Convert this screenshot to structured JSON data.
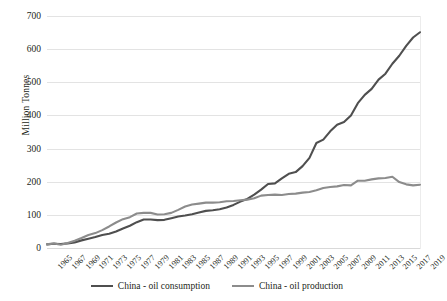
{
  "chart_data": {
    "type": "line",
    "title": "",
    "xlabel": "",
    "ylabel": "Million Tonnes",
    "ylim": [
      0,
      700
    ],
    "ytick_step": 100,
    "yticks": [
      0,
      100,
      200,
      300,
      400,
      500,
      600,
      700
    ],
    "grid": "horizontal",
    "legend_position": "bottom-center",
    "xlim": [
      1965,
      2019
    ],
    "xtick_step": 2,
    "xticks": [
      "1965",
      "1967",
      "1969",
      "1971",
      "1973",
      "1975",
      "1977",
      "1979",
      "1981",
      "1983",
      "1985",
      "1987",
      "1989",
      "1991",
      "1993",
      "1995",
      "1997",
      "1999",
      "2001",
      "2003",
      "2005",
      "2007",
      "2009",
      "2011",
      "2013",
      "2015",
      "2017",
      "2019"
    ],
    "x": [
      1965,
      1966,
      1967,
      1968,
      1969,
      1970,
      1971,
      1972,
      1973,
      1974,
      1975,
      1976,
      1977,
      1978,
      1979,
      1980,
      1981,
      1982,
      1983,
      1984,
      1985,
      1986,
      1987,
      1988,
      1989,
      1990,
      1991,
      1992,
      1993,
      1994,
      1995,
      1996,
      1997,
      1998,
      1999,
      2000,
      2001,
      2002,
      2003,
      2004,
      2005,
      2006,
      2007,
      2008,
      2009,
      2010,
      2011,
      2012,
      2013,
      2014,
      2015,
      2016,
      2017,
      2018,
      2019
    ],
    "series": [
      {
        "name": "China - oil consumption",
        "color": "#4f4f4f",
        "values": [
          11,
          13,
          12,
          14,
          17,
          23,
          28,
          33,
          39,
          43,
          50,
          59,
          67,
          78,
          86,
          86,
          84,
          85,
          90,
          95,
          98,
          102,
          107,
          112,
          114,
          117,
          122,
          130,
          140,
          148,
          161,
          176,
          193,
          195,
          210,
          224,
          229,
          247,
          272,
          317,
          327,
          352,
          372,
          380,
          400,
          437,
          462,
          480,
          508,
          526,
          556,
          580,
          610,
          635,
          651
        ]
      },
      {
        "name": "China - oil production",
        "color": "#8c8c8c",
        "values": [
          11,
          14,
          10,
          15,
          22,
          30,
          39,
          45,
          54,
          65,
          77,
          87,
          93,
          104,
          106,
          106,
          101,
          102,
          106,
          115,
          125,
          131,
          134,
          137,
          137,
          138,
          141,
          142,
          144,
          146,
          150,
          158,
          160,
          161,
          160,
          163,
          164,
          167,
          169,
          174,
          181,
          184,
          186,
          190,
          189,
          203,
          203,
          207,
          210,
          211,
          215,
          199,
          192,
          189,
          191
        ]
      }
    ]
  },
  "legend": {
    "items": [
      {
        "label": "China - oil consumption",
        "color": "#4f4f4f"
      },
      {
        "label": "China - oil production",
        "color": "#8c8c8c"
      }
    ]
  }
}
